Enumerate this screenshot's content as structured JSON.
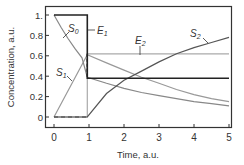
{
  "chart_data": {
    "type": "line",
    "title": "",
    "xlabel": "Time, a.u.",
    "ylabel": "Concentration, a.u.",
    "xlim": [
      -0.25,
      5.2
    ],
    "ylim": [
      -0.05,
      1.1
    ],
    "grid": false,
    "xticks": [
      "0",
      "1",
      "2",
      "3",
      "4",
      "5"
    ],
    "yticks": [
      "0",
      "0.2",
      "0.4",
      "0.6",
      "0.8",
      "1."
    ],
    "series": [
      {
        "name": "E1",
        "label": "E",
        "sub": "1",
        "color": "#222222",
        "x": [
          0,
          0.95,
          0.95,
          5
        ],
        "y": [
          1.0,
          1.0,
          0.38,
          0.38
        ]
      },
      {
        "name": "E2",
        "label": "E",
        "sub": "2",
        "color": "#aaaaaa",
        "x": [
          0,
          0.95,
          0.95,
          5
        ],
        "y": [
          0,
          0,
          0.62,
          0.62
        ]
      },
      {
        "name": "S0",
        "label": "S",
        "sub": "0",
        "color": "#888888",
        "x": [
          0,
          0.2,
          0.4,
          0.6,
          0.8,
          0.95,
          1.5,
          2,
          2.5,
          3,
          3.5,
          4,
          4.5,
          5
        ],
        "y": [
          1.0,
          0.88,
          0.77,
          0.67,
          0.58,
          0.39,
          0.33,
          0.28,
          0.24,
          0.21,
          0.18,
          0.15,
          0.13,
          0.11
        ]
      },
      {
        "name": "S1",
        "label": "S",
        "sub": "1",
        "color": "#999999",
        "x": [
          0,
          0.95,
          1.5,
          2,
          2.5,
          3,
          3.5,
          4,
          4.5,
          5
        ],
        "y": [
          0,
          0.61,
          0.53,
          0.46,
          0.39,
          0.33,
          0.27,
          0.22,
          0.18,
          0.15
        ]
      },
      {
        "name": "S2",
        "label": "S",
        "sub": "2",
        "color": "#555555",
        "x": [
          0,
          0.95,
          1.5,
          2,
          2.5,
          3,
          3.5,
          4,
          4.5,
          5
        ],
        "y": [
          0,
          0,
          0.23,
          0.36,
          0.45,
          0.54,
          0.62,
          0.68,
          0.73,
          0.78
        ]
      }
    ],
    "annotations": [
      {
        "text": "S0",
        "series": "S0"
      },
      {
        "text": "E1",
        "series": "E1"
      },
      {
        "text": "E2",
        "series": "E2"
      },
      {
        "text": "S1",
        "series": "S1"
      },
      {
        "text": "S2",
        "series": "S2"
      }
    ],
    "legend": "none (inline labels)"
  }
}
